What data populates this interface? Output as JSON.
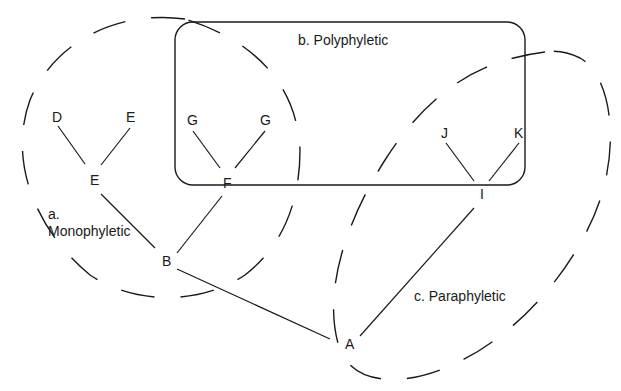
{
  "diagram": {
    "type": "phylogenetic-tree-groupings",
    "nodes": [
      {
        "id": "D",
        "label": "D",
        "x": 30,
        "y": 122
      },
      {
        "id": "E1",
        "label": "E",
        "x": 101,
        "y": 122
      },
      {
        "id": "E2",
        "label": "E",
        "x": 95,
        "y": 185
      },
      {
        "id": "G1",
        "label": "G",
        "x": 193,
        "y": 125
      },
      {
        "id": "G2",
        "label": "G",
        "x": 266,
        "y": 125
      },
      {
        "id": "F",
        "label": "F",
        "x": 228,
        "y": 188
      },
      {
        "id": "J",
        "label": "J",
        "x": 446,
        "y": 138
      },
      {
        "id": "K",
        "label": "K",
        "x": 519,
        "y": 138
      },
      {
        "id": "I",
        "label": "I",
        "x": 483,
        "y": 199
      },
      {
        "id": "B",
        "label": "B",
        "x": 167,
        "y": 266
      },
      {
        "id": "A",
        "label": "A",
        "x": 350,
        "y": 349
      }
    ],
    "edges": [
      {
        "from": "D",
        "to": "E2",
        "x1": 58,
        "y1": 126,
        "x2": 85,
        "y2": 164
      },
      {
        "from": "E1",
        "to": "E2",
        "x1": 130,
        "y1": 128,
        "x2": 101,
        "y2": 165
      },
      {
        "from": "G1",
        "to": "F",
        "x1": 193,
        "y1": 131,
        "x2": 220,
        "y2": 168
      },
      {
        "from": "G2",
        "to": "F",
        "x1": 265,
        "y1": 131,
        "x2": 235,
        "y2": 168
      },
      {
        "from": "J",
        "to": "I",
        "x1": 446,
        "y1": 143,
        "x2": 474,
        "y2": 181
      },
      {
        "from": "K",
        "to": "I",
        "x1": 519,
        "y1": 143,
        "x2": 489,
        "y2": 181
      },
      {
        "from": "E2",
        "to": "B",
        "x1": 101,
        "y1": 194,
        "x2": 155,
        "y2": 248
      },
      {
        "from": "F",
        "to": "B",
        "x1": 222,
        "y1": 196,
        "x2": 177,
        "y2": 253
      },
      {
        "from": "B",
        "to": "A",
        "x1": 177,
        "y1": 269,
        "x2": 330,
        "y2": 339
      },
      {
        "from": "I",
        "to": "A",
        "x1": 474,
        "y1": 208,
        "x2": 360,
        "y2": 336
      }
    ],
    "groups": {
      "monophyletic": {
        "label_line1": "a.",
        "label_line2": "Monophyletic",
        "x": 48,
        "y1": 219,
        "y2": 236
      },
      "polyphyletic": {
        "label": "b. Polyphyletic",
        "x": 298,
        "y": 45
      },
      "paraphyletic": {
        "label": "c. Paraphyletic",
        "x": 414,
        "y": 301
      }
    },
    "colors": {
      "stroke": "#1a1a1a",
      "background": "#ffffff"
    }
  }
}
